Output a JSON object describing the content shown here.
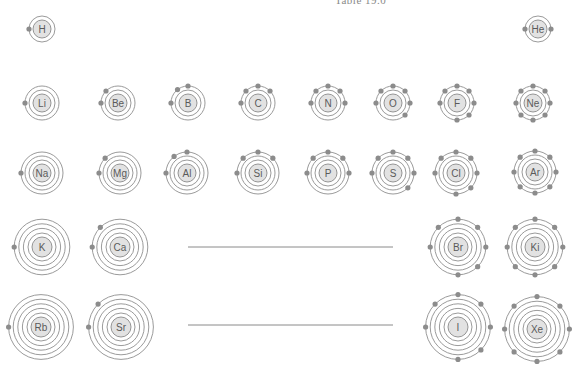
{
  "caption": "Table 19.0",
  "style": {
    "electron_color": "#8c8c8c",
    "nucleus_fill": "#e2e2e2",
    "orbit_color": "#8f8f8f"
  },
  "gap_lines": [
    {
      "x1": 188,
      "x2": 393,
      "y": 247
    },
    {
      "x1": 188,
      "x2": 393,
      "y": 325
    }
  ],
  "atoms": [
    {
      "symbol": "H",
      "x": 42,
      "y": 29,
      "shells": 1,
      "valence": 1
    },
    {
      "symbol": "He",
      "x": 538,
      "y": 29,
      "shells": 1,
      "valence": 2
    },
    {
      "symbol": "Li",
      "x": 42,
      "y": 103,
      "shells": 2,
      "valence": 1
    },
    {
      "symbol": "Be",
      "x": 118,
      "y": 103,
      "shells": 2,
      "valence": 2
    },
    {
      "symbol": "B",
      "x": 188,
      "y": 103,
      "shells": 2,
      "valence": 3
    },
    {
      "symbol": "C",
      "x": 258,
      "y": 103,
      "shells": 2,
      "valence": 4
    },
    {
      "symbol": "N",
      "x": 328,
      "y": 103,
      "shells": 2,
      "valence": 5
    },
    {
      "symbol": "O",
      "x": 393,
      "y": 103,
      "shells": 2,
      "valence": 6
    },
    {
      "symbol": "F",
      "x": 457,
      "y": 103,
      "shells": 2,
      "valence": 7
    },
    {
      "symbol": "Ne",
      "x": 533,
      "y": 103,
      "shells": 2,
      "valence": 8
    },
    {
      "symbol": "Na",
      "x": 42,
      "y": 173,
      "shells": 3,
      "valence": 1
    },
    {
      "symbol": "Mg",
      "x": 120,
      "y": 173,
      "shells": 3,
      "valence": 2
    },
    {
      "symbol": "Al",
      "x": 187,
      "y": 173,
      "shells": 3,
      "valence": 3
    },
    {
      "symbol": "Si",
      "x": 258,
      "y": 173,
      "shells": 3,
      "valence": 4
    },
    {
      "symbol": "P",
      "x": 328,
      "y": 173,
      "shells": 3,
      "valence": 5
    },
    {
      "symbol": "S",
      "x": 393,
      "y": 173,
      "shells": 3,
      "valence": 6
    },
    {
      "symbol": "Cl",
      "x": 456,
      "y": 173,
      "shells": 3,
      "valence": 7
    },
    {
      "symbol": "Ar",
      "x": 535,
      "y": 172,
      "shells": 3,
      "valence": 8
    },
    {
      "symbol": "K",
      "x": 42,
      "y": 247,
      "shells": 4,
      "valence": 1
    },
    {
      "symbol": "Ca",
      "x": 120,
      "y": 247,
      "shells": 4,
      "valence": 2
    },
    {
      "symbol": "Br",
      "x": 458,
      "y": 247,
      "shells": 4,
      "valence": 7
    },
    {
      "symbol": "Ki",
      "x": 535,
      "y": 247,
      "shells": 4,
      "valence": 8
    },
    {
      "symbol": "Rb",
      "x": 41,
      "y": 327,
      "shells": 5,
      "valence": 1
    },
    {
      "symbol": "Sr",
      "x": 121,
      "y": 327,
      "shells": 5,
      "valence": 2
    },
    {
      "symbol": "I",
      "x": 458,
      "y": 327,
      "shells": 5,
      "valence": 7
    },
    {
      "symbol": "Xe",
      "x": 537,
      "y": 329,
      "shells": 5,
      "valence": 8
    }
  ]
}
